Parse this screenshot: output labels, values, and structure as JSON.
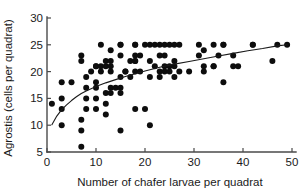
{
  "chart_data": {
    "type": "scatter",
    "title": "",
    "xlabel": "Number of chafer larvae per quadrat",
    "ylabel": "Agrostis (cells per quadrat)",
    "xlim": [
      0,
      50
    ],
    "ylim": [
      5,
      30
    ],
    "xticks": [
      0,
      10,
      20,
      30,
      40,
      50
    ],
    "yticks": [
      5,
      10,
      15,
      20,
      25,
      30
    ],
    "xtick_labels": [
      "0",
      "10",
      "20",
      "30",
      "40",
      "50"
    ],
    "ytick_labels": [
      "5",
      "10",
      "15",
      "20",
      "25",
      "30"
    ],
    "grid": false,
    "legend": null,
    "marker": {
      "shape": "circle",
      "color": "#0d0d0d",
      "size": 4.0
    },
    "points": [
      [
        1,
        14
      ],
      [
        3,
        18
      ],
      [
        3,
        13
      ],
      [
        3,
        15
      ],
      [
        3,
        10
      ],
      [
        5,
        18
      ],
      [
        7,
        23
      ],
      [
        7,
        22
      ],
      [
        7,
        11
      ],
      [
        7,
        9
      ],
      [
        7,
        6
      ],
      [
        8,
        19
      ],
      [
        8,
        17
      ],
      [
        8,
        15
      ],
      [
        8,
        13
      ],
      [
        9,
        20
      ],
      [
        10,
        21
      ],
      [
        10,
        21
      ],
      [
        10,
        18
      ],
      [
        10,
        17
      ],
      [
        10,
        15
      ],
      [
        10,
        13
      ],
      [
        11,
        25
      ],
      [
        11,
        21
      ],
      [
        11,
        20
      ],
      [
        12,
        22
      ],
      [
        12,
        21
      ],
      [
        12,
        16
      ],
      [
        12,
        14
      ],
      [
        12,
        12
      ],
      [
        13,
        24
      ],
      [
        13,
        22
      ],
      [
        13,
        21
      ],
      [
        13,
        20
      ],
      [
        13,
        17
      ],
      [
        13,
        16
      ],
      [
        14,
        17
      ],
      [
        15,
        25
      ],
      [
        15,
        25
      ],
      [
        15,
        23
      ],
      [
        15,
        19
      ],
      [
        15,
        17
      ],
      [
        15,
        16
      ],
      [
        15,
        9
      ],
      [
        16,
        20
      ],
      [
        16,
        20
      ],
      [
        17,
        22
      ],
      [
        17,
        19
      ],
      [
        18,
        25
      ],
      [
        18,
        25
      ],
      [
        18,
        23
      ],
      [
        18,
        22
      ],
      [
        18,
        22
      ],
      [
        18,
        20
      ],
      [
        18,
        13
      ],
      [
        19,
        23
      ],
      [
        19,
        20
      ],
      [
        20,
        25
      ],
      [
        20,
        13
      ],
      [
        21,
        25
      ],
      [
        21,
        22
      ],
      [
        21,
        19
      ],
      [
        21,
        10
      ],
      [
        22,
        25
      ],
      [
        22,
        21
      ],
      [
        23,
        25
      ],
      [
        23,
        23
      ],
      [
        23,
        20
      ],
      [
        23,
        19
      ],
      [
        24,
        25
      ],
      [
        24,
        23
      ],
      [
        24,
        21
      ],
      [
        24,
        20
      ],
      [
        25,
        25
      ],
      [
        25,
        21
      ],
      [
        25,
        20
      ],
      [
        26,
        25
      ],
      [
        26,
        22
      ],
      [
        26,
        21
      ],
      [
        26,
        19
      ],
      [
        27,
        25
      ],
      [
        27,
        20
      ],
      [
        29,
        20
      ],
      [
        31,
        25
      ],
      [
        31,
        23
      ],
      [
        32,
        24
      ],
      [
        32,
        21
      ],
      [
        32,
        20
      ],
      [
        34,
        25
      ],
      [
        34,
        21
      ],
      [
        34,
        21
      ],
      [
        35,
        23
      ],
      [
        36,
        25
      ],
      [
        36,
        25
      ],
      [
        36,
        18
      ],
      [
        38,
        23
      ],
      [
        38,
        21
      ],
      [
        39,
        21
      ],
      [
        42,
        25
      ],
      [
        42,
        25
      ],
      [
        46,
        22
      ],
      [
        47,
        25
      ],
      [
        49,
        25
      ]
    ],
    "fit_curve": {
      "name": "fitted curve",
      "color": "#1a1a1a",
      "x": [
        1,
        2,
        3,
        4,
        5,
        6,
        7,
        8,
        9,
        10,
        12,
        14,
        16,
        18,
        20,
        23,
        26,
        29,
        32,
        35,
        38,
        41,
        44,
        47,
        49
      ],
      "y": [
        10.1,
        11.7,
        12.9,
        13.8,
        14.6,
        15.3,
        15.9,
        16.4,
        16.8,
        17.2,
        17.9,
        18.5,
        19.1,
        19.6,
        20.1,
        20.8,
        21.4,
        21.9,
        22.4,
        22.9,
        23.4,
        23.9,
        24.3,
        24.8,
        25.0
      ]
    }
  }
}
